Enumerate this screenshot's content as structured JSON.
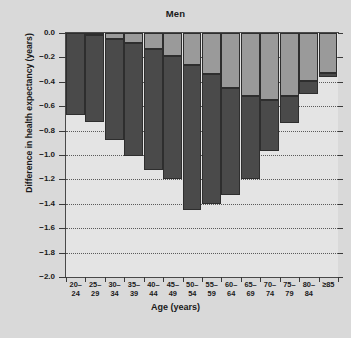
{
  "chart_data": {
    "type": "bar",
    "subtype": "stacked-bar",
    "title": "Men",
    "xlabel": "Age (years)",
    "ylabel": "Difference in health expectancy (years)",
    "ylim": [
      -2.0,
      0.0
    ],
    "ytick_labels": [
      "0.0",
      "-0.2",
      "-0.4",
      "-0.6",
      "-0.8",
      "-1.0",
      "-1.2",
      "-1.4",
      "-1.6",
      "-1.8",
      "-2.0"
    ],
    "ytick_values": [
      0.0,
      -0.2,
      -0.4,
      -0.6,
      -0.8,
      -1.0,
      -1.2,
      -1.4,
      -1.6,
      -1.8,
      -2.0
    ],
    "grid": "horizontal dotted gridlines",
    "legend": "none",
    "categories": [
      "20-24",
      "25-29",
      "30-34",
      "35-39",
      "40-44",
      "45-49",
      "50-54",
      "55-59",
      "60-64",
      "65-69",
      "70-74",
      "75-79",
      "80-84",
      ">=85"
    ],
    "category_lines": [
      [
        "20–",
        "24"
      ],
      [
        "25–",
        "29"
      ],
      [
        "30–",
        "34"
      ],
      [
        "35–",
        "39"
      ],
      [
        "40–",
        "44"
      ],
      [
        "45–",
        "49"
      ],
      [
        "50–",
        "54"
      ],
      [
        "55–",
        "59"
      ],
      [
        "60–",
        "64"
      ],
      [
        "65–",
        "69"
      ],
      [
        "70–",
        "74"
      ],
      [
        "75–",
        "79"
      ],
      [
        "80–",
        "84"
      ],
      [
        "≥85",
        ""
      ]
    ],
    "series": [
      {
        "name": "upper segment",
        "color": "#9a9a9a",
        "values": [
          0.0,
          -0.02,
          -0.05,
          -0.08,
          -0.13,
          -0.19,
          -0.26,
          -0.34,
          -0.45,
          -0.52,
          -0.55,
          -0.52,
          -0.39,
          -0.33
        ]
      },
      {
        "name": "lower segment",
        "color": "#4a4a4a",
        "values": [
          -0.67,
          -0.71,
          -0.83,
          -0.93,
          -0.99,
          -1.01,
          -1.19,
          -1.06,
          -0.88,
          -0.68,
          -0.42,
          -0.22,
          -0.11,
          -0.03
        ]
      }
    ],
    "totals": [
      -0.67,
      -0.73,
      -0.88,
      -1.01,
      -1.12,
      -1.2,
      -1.45,
      -1.4,
      -1.33,
      -1.2,
      -0.97,
      -0.74,
      -0.5,
      -0.36
    ],
    "background_color": "#d9d9d9",
    "plot_background_color": "#e4e4e4"
  }
}
